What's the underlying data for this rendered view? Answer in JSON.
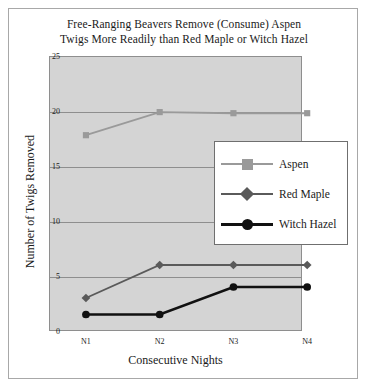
{
  "chart_data": {
    "type": "line",
    "title": "Free-Ranging Beavers Remove (Consume) Aspen Twigs More Readily than Red Maple or Witch Hazel",
    "title_lines": [
      "Free-Ranging Beavers Remove (Consume) Aspen",
      "Twigs More Readily than Red Maple or Witch Hazel"
    ],
    "xlabel": "Consecutive Nights",
    "ylabel": "Number of Twigs Removed",
    "categories": [
      "N1",
      "N2",
      "N3",
      "N4"
    ],
    "ylim": [
      0,
      25
    ],
    "yticks": [
      0,
      5,
      10,
      15,
      20,
      25
    ],
    "grid": true,
    "legend_position": "center-right",
    "series": [
      {
        "name": "Aspen",
        "values": [
          17.8,
          19.9,
          19.8,
          19.8
        ],
        "color": "#9a9a9a",
        "marker": "square"
      },
      {
        "name": "Red Maple",
        "values": [
          3.0,
          6.0,
          6.0,
          6.0
        ],
        "color": "#5a5a5a",
        "marker": "diamond"
      },
      {
        "name": "Witch Hazel",
        "values": [
          1.5,
          1.5,
          4.0,
          4.0
        ],
        "color": "#111111",
        "marker": "circle"
      }
    ]
  },
  "style": {
    "plot_background": "#d4d4d4",
    "figure_background": "#ffffff",
    "axis_color": "#8e8e8e",
    "frame_color": "#a8a8a8",
    "text_color": "#1a1a1a"
  }
}
